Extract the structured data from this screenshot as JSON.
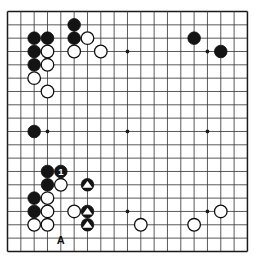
{
  "diagram": {
    "type": "go-board-diagram",
    "board_size": 19,
    "grid": {
      "left": 7.5,
      "top": 11.5,
      "spacing": 13.33,
      "lines": 19,
      "line_color": "#3c3c3c",
      "border_color": "#1a1a1a",
      "background": "#ffffff",
      "star_points": [
        {
          "col": 3,
          "row": 3
        },
        {
          "col": 9,
          "row": 3
        },
        {
          "col": 15,
          "row": 3
        },
        {
          "col": 3,
          "row": 9
        },
        {
          "col": 9,
          "row": 9
        },
        {
          "col": 15,
          "row": 9
        },
        {
          "col": 3,
          "row": 15
        },
        {
          "col": 9,
          "row": 15
        },
        {
          "col": 15,
          "row": 15
        }
      ]
    },
    "stone_radius": 6.3,
    "colors": {
      "black_stone": "#141414",
      "white_stone": "#ffffff",
      "stone_outline": "#101010",
      "marker": "#ffffff",
      "label_text": "#101010"
    },
    "black_stones": [
      {
        "col": 5,
        "row": 1
      },
      {
        "col": 2,
        "row": 2
      },
      {
        "col": 3,
        "row": 2
      },
      {
        "col": 5,
        "row": 2
      },
      {
        "col": 2,
        "row": 3
      },
      {
        "col": 2,
        "row": 4
      },
      {
        "col": 2,
        "row": 9
      },
      {
        "col": 14,
        "row": 2
      },
      {
        "col": 16,
        "row": 3
      },
      {
        "col": 3,
        "row": 12
      },
      {
        "col": 4,
        "row": 12
      },
      {
        "col": 3,
        "row": 13
      },
      {
        "col": 2,
        "row": 14
      },
      {
        "col": 2,
        "row": 15
      },
      {
        "col": 6,
        "row": 13
      },
      {
        "col": 6,
        "row": 15
      },
      {
        "col": 6,
        "row": 16
      }
    ],
    "white_stones": [
      {
        "col": 6,
        "row": 2
      },
      {
        "col": 3,
        "row": 3
      },
      {
        "col": 5,
        "row": 3
      },
      {
        "col": 7,
        "row": 3
      },
      {
        "col": 3,
        "row": 4
      },
      {
        "col": 2,
        "row": 5
      },
      {
        "col": 3,
        "row": 6
      },
      {
        "col": 4,
        "row": 13
      },
      {
        "col": 3,
        "row": 14
      },
      {
        "col": 3,
        "row": 15
      },
      {
        "col": 5,
        "row": 15
      },
      {
        "col": 2,
        "row": 16
      },
      {
        "col": 3,
        "row": 16
      },
      {
        "col": 10,
        "row": 16
      },
      {
        "col": 14,
        "row": 16
      },
      {
        "col": 16,
        "row": 15
      }
    ],
    "numbered_stones": [
      {
        "col": 4,
        "row": 12,
        "label": "1",
        "stone_color": "black",
        "text_color": "#ffffff"
      }
    ],
    "triangle_marked_stones": [
      {
        "col": 6,
        "row": 13,
        "stone_color": "black",
        "marker_color": "#ffffff"
      },
      {
        "col": 6,
        "row": 15,
        "stone_color": "black",
        "marker_color": "#ffffff"
      },
      {
        "col": 6,
        "row": 16,
        "stone_color": "black",
        "marker_color": "#ffffff"
      }
    ],
    "coordinate_labels": [
      {
        "text": "A",
        "col": 4,
        "row": 17.45
      }
    ]
  }
}
